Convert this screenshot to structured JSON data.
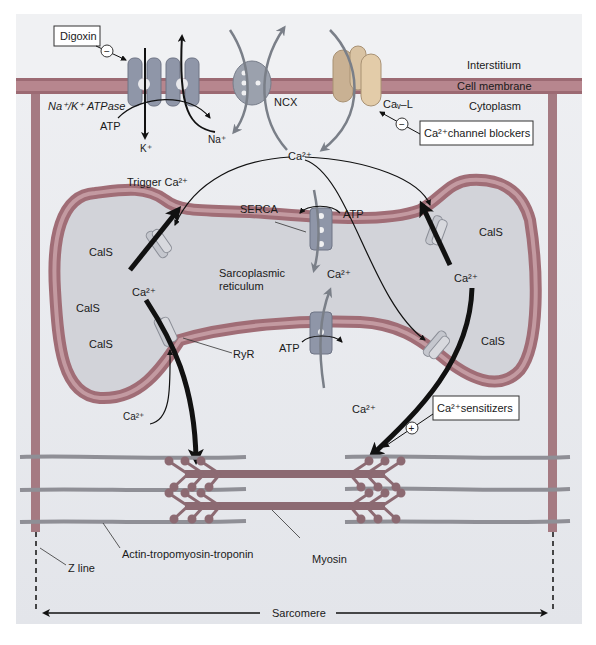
{
  "colors": {
    "background": "#e9eaee",
    "interstitium": "#eeeff2",
    "membrane": "#b7868e",
    "membrane_dark": "#9c6a73",
    "sr_fill": "#d3d4da",
    "sr_wall": "#a06d76",
    "protein": "#8f96a8",
    "pump": "#c99aa0",
    "channel_cav": "#e3c9a4",
    "myosin": "#8c6a72",
    "actin": "#9a9aa0",
    "arrow": "#111111",
    "grey_arrow": "#7a7f88"
  },
  "compartments": {
    "interstitium": "Interstitium",
    "cell_membrane": "Cell membrane",
    "cytoplasm": "Cytoplasm",
    "sr": [
      "Sarcoplasmic",
      "reticulum"
    ]
  },
  "transporters": {
    "nak_atpase": "Na⁺/K⁺ ATPase",
    "ncx": "NCX",
    "cav": "Caᵥ–L",
    "serca": "SERCA",
    "ryr": "RyR"
  },
  "ions": {
    "atp": "ATP",
    "k": "K⁺",
    "na": "Na⁺",
    "ca": "Ca²⁺",
    "trigger_ca": "Trigger Ca²⁺"
  },
  "drugs": {
    "digoxin": "Digoxin",
    "ca_blockers": "Ca²⁺channel blockers",
    "ca_sensitizers": "Ca²⁺sensitizers",
    "minus": "−",
    "plus": "+"
  },
  "cals": "CalS",
  "contractile": {
    "actin": "Actin-tropomyosin-troponin",
    "myosin": "Myosin",
    "z_line": "Z line",
    "sarcomere": "Sarcomere"
  }
}
